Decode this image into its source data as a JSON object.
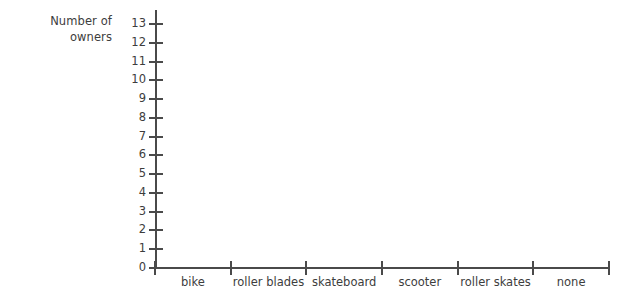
{
  "chart_data": {
    "type": "bar",
    "title": "",
    "subtitle": "",
    "xlabel": "",
    "ylabel": "Number of\nowners",
    "categories": [
      "bike",
      "roller blades",
      "skateboard",
      "scooter",
      "roller skates",
      "none"
    ],
    "values": [
      null,
      null,
      null,
      null,
      null,
      null
    ],
    "series": [
      {
        "name": "",
        "values": [
          null,
          null,
          null,
          null,
          null,
          null
        ]
      }
    ],
    "ytick_labels": [
      "13",
      "12",
      "11",
      "10",
      "9",
      "8",
      "7",
      "6",
      "5",
      "4",
      "3",
      "2",
      "1",
      "0"
    ],
    "ytick_values": [
      13,
      12,
      11,
      10,
      9,
      8,
      7,
      6,
      5,
      4,
      3,
      2,
      1,
      0
    ],
    "ylim": [
      0,
      13
    ],
    "ystep": 1,
    "grid": false,
    "legend": false,
    "legend_position": "none",
    "bars_drawn": false,
    "note": "Empty axes template - no bars plotted",
    "colors": {
      "axis": "#4a4a4a",
      "text": "#3d3d3d",
      "background": "#ffffff"
    }
  },
  "axis_title": {
    "line1": "Number of",
    "line2": "owners"
  }
}
